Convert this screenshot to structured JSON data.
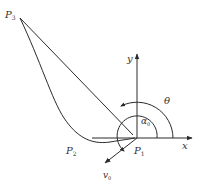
{
  "diagram": {
    "type": "geometry / trajectory diagram",
    "colors": {
      "stroke": "#2a2a2a",
      "background": "#ffffff",
      "text": "#333333"
    },
    "labels": {
      "p3": {
        "main": "P",
        "sub": "3"
      },
      "p2": {
        "main": "P",
        "sub": "2"
      },
      "p1": {
        "main": "P",
        "sub": "1"
      },
      "v0": {
        "main": "v",
        "sub": "0"
      },
      "y_axis": "y",
      "x_axis": "x",
      "theta": "θ",
      "alpha0": {
        "main": "α",
        "sub": "0"
      }
    },
    "points": {
      "P3": [
        20,
        18
      ],
      "P1": [
        137,
        138
      ],
      "P2_label_near": [
        72,
        152
      ]
    },
    "axes": {
      "x": {
        "from": [
          92,
          138
        ],
        "to": [
          192,
          138
        ]
      },
      "y": {
        "from": [
          137,
          138
        ],
        "to": [
          137,
          54
        ]
      }
    },
    "arcs": {
      "theta": {
        "center": [
          137,
          138
        ],
        "radius": 36,
        "arrow": true
      },
      "alpha0": {
        "center": [
          137,
          138
        ],
        "radius": 20,
        "arrow": true
      }
    },
    "velocity_vector": {
      "from": [
        137,
        138
      ],
      "to": [
        105,
        163
      ]
    }
  }
}
